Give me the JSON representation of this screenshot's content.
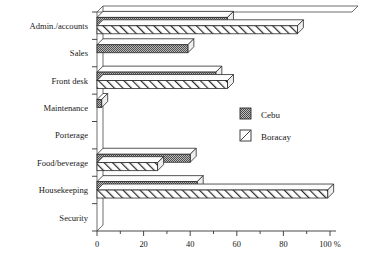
{
  "chart_data": {
    "type": "bar",
    "orientation": "horizontal",
    "title": "",
    "subtitle": "",
    "xlabel": "",
    "ylabel": "",
    "xlim": [
      0,
      100
    ],
    "xunit": "%",
    "grid": false,
    "legend_position": "right-middle",
    "xticks": [
      0,
      20,
      40,
      60,
      80,
      100
    ],
    "xtick_labels": [
      "0",
      "20",
      "40",
      "60",
      "80",
      "100 %"
    ],
    "minor_xticks": [
      10,
      30,
      50,
      70,
      90
    ],
    "categories": [
      "Admin./accounts",
      "Sales",
      "Front desk",
      "Maintenance",
      "Porterage",
      "Food/beverage",
      "Housekeeping",
      "Security"
    ],
    "series": [
      {
        "name": "Cebu",
        "pattern": "checker",
        "values": [
          56,
          39,
          51,
          2,
          0,
          40,
          43,
          0
        ]
      },
      {
        "name": "Boracay",
        "pattern": "diagonal-hatch",
        "values": [
          86,
          0,
          56,
          0,
          0,
          26,
          99,
          0
        ]
      }
    ]
  },
  "legend": {
    "entries": [
      {
        "label": "Cebu",
        "swatch": "checker-swatch"
      },
      {
        "label": "Boracay",
        "swatch": "hatch-swatch"
      }
    ]
  },
  "colors": {
    "cebu_fill": "#8a8a8a",
    "boracay_fill": "#ffffff",
    "outline": "#222222",
    "axis": "#333333",
    "background": "#ffffff"
  }
}
